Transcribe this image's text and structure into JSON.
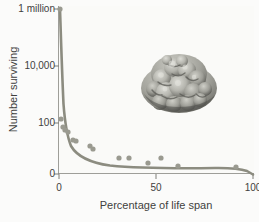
{
  "figure": {
    "background_color": "#fbfbfa",
    "curve_color": "#8c8c80",
    "point_color": "#9a9a90",
    "axis_color": "#9e9e99",
    "text_color": "#3f3f3e"
  },
  "axes": {
    "y_title": "Number surviving",
    "x_title": "Percentage of life span",
    "y_ticks": [
      "1 million",
      "10,000",
      "100",
      "0"
    ],
    "x_ticks": [
      "0",
      "50",
      "100"
    ]
  },
  "inset": {
    "name": "cell-colony-micrograph",
    "caption": ""
  },
  "bleed_text": [
    "verso text bleeding through the scanned page",
    "faint reversed characters visible behind plot",
    "survival of cells across the life span",
    "no legible content on this side of sheet",
    "ghosted type from the opposite page",
    "low contrast offset impression only",
    "residual ink showing through paper",
    "illegible mirrored line of body text",
    "another faint reversed text line here",
    "continuing ghost impression of type",
    "scanner captured reverse page shadow",
    "final faint line of bleed-through text"
  ],
  "chart_data": {
    "type": "scatter",
    "title": "",
    "xlabel": "Percentage of life span",
    "ylabel": "Number surviving",
    "xlim": [
      0,
      100
    ],
    "grid": false,
    "legend": null,
    "y_scale": "log-like compressed (1 million, 10,000, 100, 0)",
    "y_tick_labels": [
      "1 million",
      "10,000",
      "100",
      "0"
    ],
    "y_tick_values": [
      1000000,
      10000,
      100,
      0
    ],
    "x_tick_values": [
      0,
      50,
      100
    ],
    "series": [
      {
        "name": "Observed survivors",
        "type": "scatter",
        "points": [
          {
            "x": 0.5,
            "y": 1000000
          },
          {
            "x": 1.5,
            "y": 120
          },
          {
            "x": 2.5,
            "y": 70
          },
          {
            "x": 3.5,
            "y": 62
          },
          {
            "x": 5.0,
            "y": 58
          },
          {
            "x": 7.5,
            "y": 40
          },
          {
            "x": 8.5,
            "y": 38
          },
          {
            "x": 16.0,
            "y": 26
          },
          {
            "x": 17.5,
            "y": 22
          },
          {
            "x": 31.0,
            "y": 12
          },
          {
            "x": 36.0,
            "y": 12
          },
          {
            "x": 46.0,
            "y": 8
          },
          {
            "x": 53.0,
            "y": 12
          },
          {
            "x": 62.0,
            "y": 6
          },
          {
            "x": 92.0,
            "y": 5
          }
        ]
      },
      {
        "name": "Fitted survival curve",
        "type": "line",
        "points": [
          {
            "x": 0.3,
            "y": 1000000
          },
          {
            "x": 1.0,
            "y": 9000
          },
          {
            "x": 2.0,
            "y": 800
          },
          {
            "x": 3.0,
            "y": 160
          },
          {
            "x": 5.0,
            "y": 70
          },
          {
            "x": 8.0,
            "y": 40
          },
          {
            "x": 12.0,
            "y": 22
          },
          {
            "x": 18.0,
            "y": 12
          },
          {
            "x": 25.0,
            "y": 8
          },
          {
            "x": 40.0,
            "y": 6
          },
          {
            "x": 60.0,
            "y": 5
          },
          {
            "x": 85.0,
            "y": 5
          },
          {
            "x": 94.0,
            "y": 4
          },
          {
            "x": 100.0,
            "y": 0
          }
        ]
      }
    ]
  }
}
